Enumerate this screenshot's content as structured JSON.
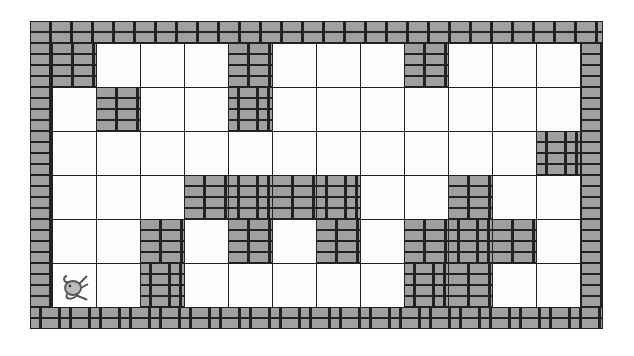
{
  "game": {
    "type": "maze-grid",
    "rows": 6,
    "cols": 12,
    "cell_size_px": 44,
    "colors": {
      "wall": "#a0a0a0",
      "mortar": "#222222",
      "open": "#fdfdfd"
    },
    "walls": [
      [
        1,
        0,
        0,
        0,
        1,
        0,
        0,
        0,
        1,
        0,
        0,
        0
      ],
      [
        0,
        1,
        0,
        0,
        1,
        0,
        0,
        0,
        0,
        0,
        0,
        0
      ],
      [
        0,
        0,
        0,
        0,
        0,
        0,
        0,
        0,
        0,
        0,
        0,
        1
      ],
      [
        0,
        0,
        0,
        1,
        1,
        1,
        1,
        0,
        0,
        1,
        0,
        0
      ],
      [
        0,
        0,
        1,
        0,
        1,
        0,
        1,
        0,
        1,
        1,
        1,
        0
      ],
      [
        0,
        0,
        1,
        0,
        0,
        0,
        0,
        0,
        1,
        1,
        0,
        0
      ]
    ],
    "player": {
      "icon": "mouse-icon",
      "row": 5,
      "col": 0
    }
  }
}
